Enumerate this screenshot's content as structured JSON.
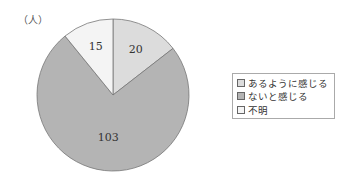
{
  "chart_data": {
    "type": "pie",
    "unit_label": "（人）",
    "categories": [
      "あるように感じる",
      "ないと感じる",
      "不明"
    ],
    "values": [
      20,
      103,
      15
    ],
    "colors": [
      "#dcdcdc",
      "#b4b4b4",
      "#f4f4f4"
    ],
    "legend": [
      "あるように感じる",
      "ないと感じる",
      "不明"
    ],
    "legend_position": "right",
    "start_angle": "top, clockwise"
  },
  "labels": {
    "v0": "20",
    "v1": "103",
    "v2": "15"
  }
}
